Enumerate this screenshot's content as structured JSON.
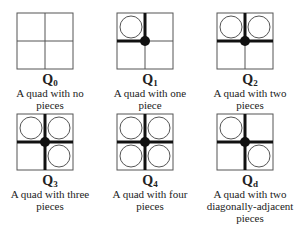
{
  "figure": {
    "quads": [
      {
        "id": "Q0",
        "letter": "Q",
        "subscript": "0",
        "caption": "A quad with no pieces",
        "pieces": []
      },
      {
        "id": "Q1",
        "letter": "Q",
        "subscript": "1",
        "caption": "A quad with one piece",
        "pieces": [
          "top-left"
        ]
      },
      {
        "id": "Q2",
        "letter": "Q",
        "subscript": "2",
        "caption": "A quad with two pieces",
        "pieces": [
          "top-left",
          "top-right"
        ]
      },
      {
        "id": "Q3",
        "letter": "Q",
        "subscript": "3",
        "caption": "A quad with three pieces",
        "pieces": [
          "top-left",
          "top-right",
          "bottom-right"
        ]
      },
      {
        "id": "Q4",
        "letter": "Q",
        "subscript": "4",
        "caption": "A quad with four pieces",
        "pieces": [
          "top-left",
          "top-right",
          "bottom-left",
          "bottom-right"
        ]
      },
      {
        "id": "Qd",
        "letter": "Q",
        "subscript": "d",
        "caption": "A quad with two diagonally-adjacent pieces",
        "pieces": [
          "top-left",
          "bottom-right"
        ]
      }
    ]
  },
  "colors": {
    "grid": "#555555",
    "thick": "#111111",
    "dot": "#111111",
    "circle": "#555555"
  }
}
